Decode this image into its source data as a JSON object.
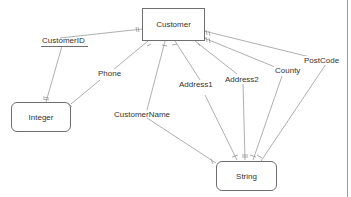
{
  "diagram": {
    "type": "entity-attribute-diagram",
    "nodes": {
      "customer": {
        "label": "Customer",
        "shape": "rectangle"
      },
      "integer": {
        "label": "Integer",
        "shape": "rounded-rectangle"
      },
      "string": {
        "label": "String",
        "shape": "rounded-rectangle"
      }
    },
    "attributes": [
      {
        "id": "customerid",
        "label": "CustomerID",
        "key": true,
        "type": "Integer"
      },
      {
        "id": "phone",
        "label": "Phone",
        "key": false,
        "type": "Integer"
      },
      {
        "id": "customername",
        "label": "CustomerName",
        "key": false,
        "type": "String"
      },
      {
        "id": "address1",
        "label": "Address1",
        "key": false,
        "type": "String"
      },
      {
        "id": "address2",
        "label": "Address2",
        "key": false,
        "type": "String"
      },
      {
        "id": "county",
        "label": "County",
        "key": false,
        "type": "String"
      },
      {
        "id": "postcode",
        "label": "PostCode",
        "key": false,
        "type": "String"
      }
    ],
    "colors": {
      "line": "#9a9a9a",
      "border": "#6e6e6e",
      "text": "#333333",
      "background": "#ffffff"
    }
  }
}
